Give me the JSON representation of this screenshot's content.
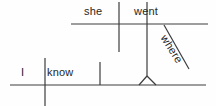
{
  "diagram": {
    "kind": "reed-kellogg-sentence-diagram",
    "sentence": "I know where she went",
    "stroke_color": "#3c3c3c",
    "background_color": "#fefefe",
    "text_color": "#262626",
    "words": {
      "she": "she",
      "went": "went",
      "i": "I",
      "know": "know",
      "where": "where"
    },
    "labels": {
      "independent_clause_subject": "I",
      "independent_clause_verb": "know",
      "subordinate_clause_subject": "she",
      "subordinate_clause_verb": "went",
      "subordinate_conjunction_adverb": "where"
    },
    "lines": {
      "upper_baseline": {
        "x1": 71,
        "y1": 24,
        "x2": 208,
        "y2": 24
      },
      "upper_subject_verb_divider": {
        "x1": 119,
        "y1": 2,
        "x2": 119,
        "y2": 52
      },
      "upper_verb_end_divider": {
        "x1": 147,
        "y1": 2,
        "x2": 147,
        "y2": 24
      },
      "where_diagonal": {
        "x1": 164,
        "y1": 25,
        "x2": 189,
        "y2": 69
      },
      "connector_stem": {
        "x1": 147,
        "y1": 24,
        "x2": 147,
        "y2": 76
      },
      "connector_leg_left": {
        "x1": 147,
        "y1": 76,
        "x2": 139,
        "y2": 85
      },
      "connector_leg_right": {
        "x1": 147,
        "y1": 76,
        "x2": 156,
        "y2": 85
      },
      "lower_baseline": {
        "x1": 10,
        "y1": 85,
        "x2": 206,
        "y2": 85
      },
      "lower_subject_verb_divider": {
        "x1": 45,
        "y1": 58,
        "x2": 45,
        "y2": 106
      },
      "lower_verb_end_divider": {
        "x1": 100,
        "y1": 62,
        "x2": 100,
        "y2": 85
      }
    }
  }
}
